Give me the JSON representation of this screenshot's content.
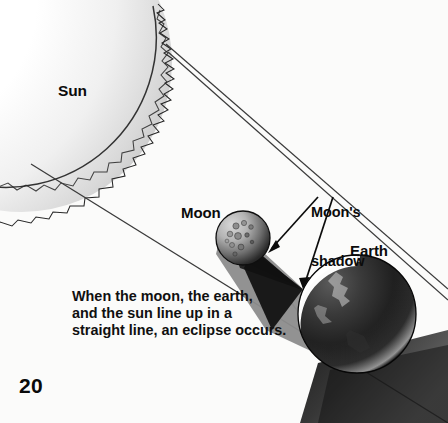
{
  "page": {
    "number": "20",
    "background_color": "#fbfbfa",
    "text_color": "#0b0b0b"
  },
  "caption": {
    "lines": [
      "When the moon, the earth,",
      "and the sun line up in a",
      "straight line, an eclipse occurs."
    ],
    "full_text": "When the moon, the earth, and the sun line up in a straight line, an eclipse occurs."
  },
  "labels": {
    "sun": "Sun",
    "moon": "Moon",
    "earth": "Earth",
    "moons_shadow_line1": "Moon's",
    "moons_shadow_line2": "shadow"
  },
  "diagram": {
    "bodies": [
      {
        "name": "sun",
        "shape": "partial-disc-with-flame-corona",
        "center_x": 22,
        "center_y": 62,
        "radius": 150,
        "fill_light": "#ffffff",
        "fill_shade": "#c9c9c9",
        "edge_color": "#2a2a2a",
        "corona": "jagged"
      },
      {
        "name": "moon",
        "shape": "sphere-with-craters",
        "center_x": 243,
        "center_y": 238,
        "radius": 27,
        "lit_color": "#bdbdbd",
        "dark_color": "#151515",
        "edge_color": "#111111",
        "crater_count": 11
      },
      {
        "name": "earth",
        "shape": "sphere-with-crescent-limb",
        "center_x": 357,
        "center_y": 314,
        "radius": 59,
        "crescent_color": "#fdfdfd",
        "dark_color": "#0d0d0d",
        "mid_color": "#4a4a4a",
        "edge_color": "#080808"
      }
    ],
    "shadows": [
      {
        "name": "moon-penumbra-cone",
        "color": "#8c8c8c",
        "from": "moon",
        "to": "earth"
      },
      {
        "name": "moon-umbra-cone",
        "color": "#141414",
        "from": "moon",
        "to": "earth"
      },
      {
        "name": "earth-shadow-cone",
        "color": "#1a1a1a",
        "from": "earth",
        "to": "lower-right-edge"
      }
    ],
    "rays": [
      {
        "name": "sun-ray-upper",
        "x1": 166,
        "y1": 44,
        "x2": 448,
        "y2": 286,
        "color": "#3a3a3a"
      },
      {
        "name": "sun-ray-lower",
        "x1": 31,
        "y1": 164,
        "x2": 448,
        "y2": 423,
        "color": "#3a3a3a"
      }
    ],
    "leaders": [
      {
        "name": "moons-shadow-leader-left",
        "x1": 318,
        "y1": 196,
        "x2": 268,
        "y2": 252,
        "arrow": true
      },
      {
        "name": "moons-shadow-leader-right",
        "x1": 332,
        "y1": 196,
        "x2": 302,
        "y2": 287,
        "arrow": true
      }
    ]
  }
}
